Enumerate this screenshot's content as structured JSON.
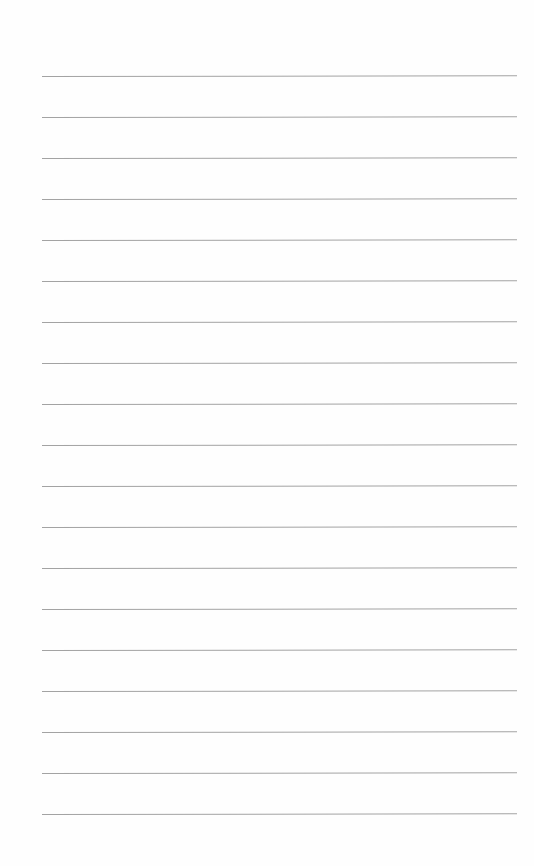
{
  "page": {
    "type": "lined-paper",
    "background_color": "#fefefe",
    "line_color": "#a3a3a3",
    "line_count": 19,
    "first_line_y": 76,
    "line_spacing": 41,
    "line_left": 42,
    "line_right": 517
  }
}
